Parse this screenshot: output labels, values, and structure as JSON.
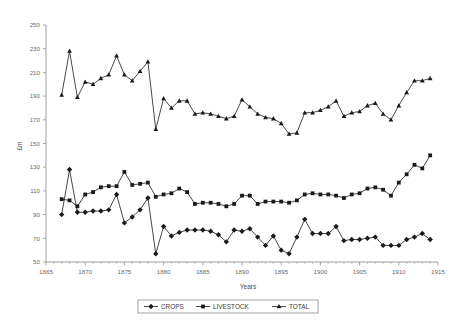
{
  "chart_data": {
    "type": "line",
    "title": "",
    "xlabel": "Years",
    "ylabel": "£m",
    "xlim": [
      1865,
      1915
    ],
    "ylim": [
      50,
      250
    ],
    "ytick_step": 20,
    "xtick_step": 5,
    "grid": false,
    "legend_position": "bottom",
    "xticks": [
      1865,
      1870,
      1875,
      1880,
      1885,
      1890,
      1895,
      1900,
      1905,
      1910,
      1915
    ],
    "yticks": [
      50,
      70,
      90,
      110,
      130,
      150,
      170,
      190,
      210,
      230,
      250
    ],
    "x": [
      1867,
      1868,
      1869,
      1870,
      1871,
      1872,
      1873,
      1874,
      1875,
      1876,
      1877,
      1878,
      1879,
      1880,
      1881,
      1882,
      1883,
      1884,
      1885,
      1886,
      1887,
      1888,
      1889,
      1890,
      1891,
      1892,
      1893,
      1894,
      1895,
      1896,
      1897,
      1898,
      1899,
      1900,
      1901,
      1902,
      1903,
      1904,
      1905,
      1906,
      1907,
      1908,
      1909,
      1910,
      1911,
      1912,
      1913,
      1914
    ],
    "series": [
      {
        "name": "CROPS",
        "marker": "diamond",
        "values": [
          90,
          128,
          92,
          92,
          93,
          93,
          94,
          107,
          83,
          88,
          94,
          104,
          57,
          80,
          72,
          75,
          77,
          77,
          77,
          76,
          73,
          67,
          77,
          76,
          78,
          71,
          64,
          72,
          60,
          57,
          71,
          86,
          74,
          74,
          74,
          80,
          68,
          69,
          69,
          70,
          71,
          64,
          64,
          64,
          69,
          71,
          74,
          69
        ]
      },
      {
        "name": "LIVESTOCK",
        "marker": "square",
        "values": [
          103,
          102,
          97,
          107,
          109,
          113,
          114,
          114,
          126,
          115,
          116,
          117,
          105,
          107,
          108,
          112,
          109,
          99,
          100,
          100,
          99,
          97,
          99,
          106,
          106,
          99,
          101,
          101,
          101,
          100,
          102,
          107,
          108,
          107,
          107,
          106,
          104,
          107,
          108,
          112,
          113,
          111,
          106,
          117,
          124,
          132,
          129,
          140
        ]
      },
      {
        "name": "TOTAL",
        "marker": "triangle",
        "values": [
          191,
          228,
          189,
          202,
          200,
          205,
          208,
          224,
          208,
          203,
          211,
          219,
          162,
          188,
          180,
          186,
          186,
          175,
          176,
          175,
          173,
          171,
          173,
          187,
          181,
          175,
          172,
          171,
          167,
          158,
          159,
          176,
          176,
          178,
          181,
          186,
          173,
          176,
          177,
          182,
          184,
          175,
          170,
          182,
          193,
          203,
          203,
          205
        ]
      }
    ]
  },
  "legend": {
    "items": [
      {
        "label": "CROPS",
        "marker": "diamond"
      },
      {
        "label": "LIVESTOCK",
        "marker": "square"
      },
      {
        "label": "TOTAL",
        "marker": "triangle"
      }
    ]
  }
}
